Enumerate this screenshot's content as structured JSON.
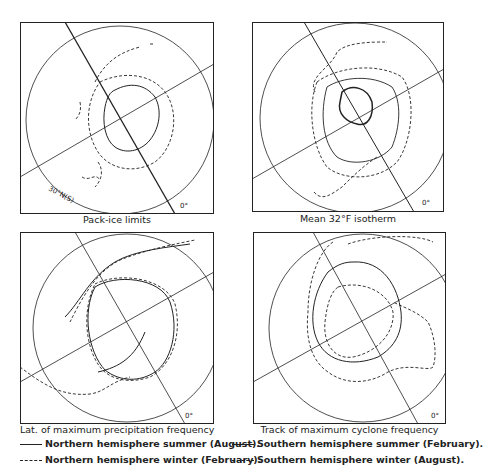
{
  "panels": [
    {
      "id": "pack-ice",
      "caption": "Pack-ice limits",
      "meridian_label": "0°",
      "lat_label": "30°N(S)"
    },
    {
      "id": "isotherm",
      "caption": "Mean 32°F isotherm",
      "meridian_label": "0°"
    },
    {
      "id": "precip",
      "caption": "Lat. of maximum precipitation frequency",
      "meridian_label": "0°"
    },
    {
      "id": "cyclone",
      "caption": "Track of maximum cyclone frequency",
      "meridian_label": "0°"
    }
  ],
  "legend": {
    "north_summer": "Northern hemisphere summer (August).",
    "north_winter": "Northern hemisphere winter (February).",
    "south_summer": "Southern hemisphere summer (February).",
    "south_winter": "Southern hemisphere winter (August)."
  },
  "colors": {
    "ink": "#222222",
    "background": "#ffffff"
  }
}
